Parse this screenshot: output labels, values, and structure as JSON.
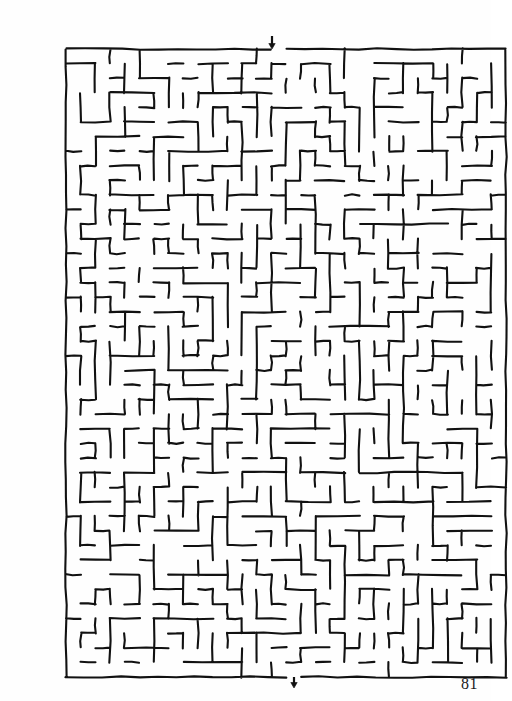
{
  "page": {
    "number_label": "81",
    "background_color": "#ffffff",
    "ink_color": "#111111",
    "width": 491,
    "height": 701
  },
  "puzzle": {
    "kind": "rectangular-maze",
    "style": "hand-drawn-ink",
    "entrance_label": "entrance-arrow-top",
    "exit_label": "exit-arrow-bottom"
  },
  "chart_data": {
    "type": "maze",
    "title": "",
    "grid": {
      "cols": 30,
      "rows": 43,
      "cell": 14.7
    },
    "bounds": {
      "x": 26,
      "y": 33,
      "width": 440,
      "height": 628
    },
    "entrance": {
      "col": 14,
      "side": "top",
      "x": 232,
      "y": 33
    },
    "exit": {
      "col": 15,
      "side": "bottom",
      "x": 253,
      "y": 661
    },
    "arrows": [
      {
        "name": "entrance-arrow",
        "x": 232,
        "y": 20,
        "direction": "down",
        "length": 13
      },
      {
        "name": "exit-arrow",
        "x": 254,
        "y": 661,
        "direction": "down",
        "length": 11
      }
    ],
    "seed": 81731,
    "wall_stroke_width": 2.1,
    "grid_on": false,
    "legend": "none"
  }
}
